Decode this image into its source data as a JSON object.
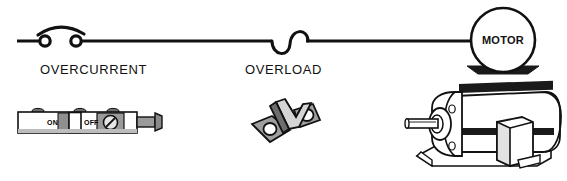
{
  "figure": {
    "type": "electrical-schematic-with-photos",
    "background": "#ffffff",
    "ink": "#111111",
    "title_text": ""
  },
  "schematic": {
    "wire_color": "#111111",
    "overcurrent": {
      "symbol_name": "overcurrent-switch-symbol",
      "label": "OVERCURRENT"
    },
    "overload": {
      "symbol_name": "overload-coil-symbol",
      "label": "OVERLOAD"
    },
    "motor": {
      "symbol_name": "motor-circle-symbol",
      "label": "MOTOR",
      "base_color": "#1a1a1a"
    }
  },
  "components": {
    "breaker": {
      "name": "circuit-breaker",
      "on_label": "ON",
      "off_label": "OFF",
      "body_color": "#ffffff",
      "shade_color": "#9a9a9a",
      "toggle_color": "#ffffff"
    },
    "heater": {
      "name": "overload-heater-element",
      "face_light": "#d0d0d0",
      "face_mid": "#9e9e9e",
      "face_dark": "#6d6d6d"
    },
    "motor_unit": {
      "name": "electric-motor",
      "fin_color": "#1a1a1a",
      "body_color": "#ffffff"
    }
  }
}
